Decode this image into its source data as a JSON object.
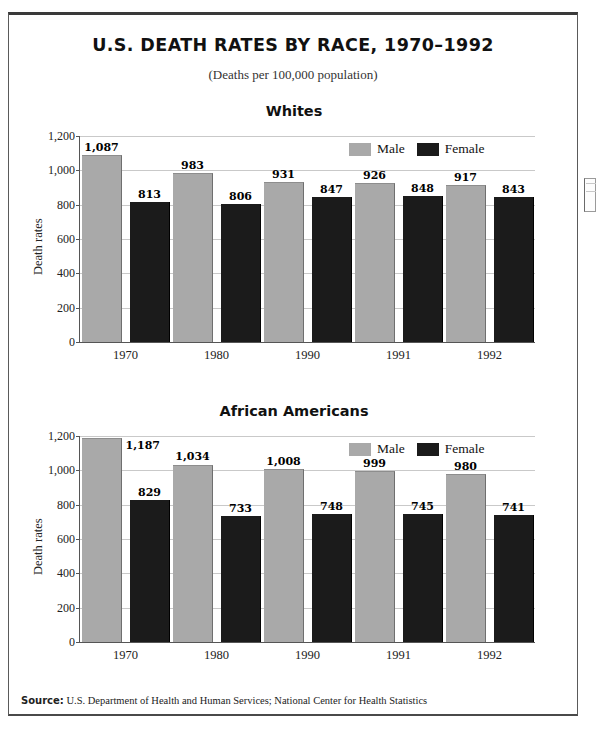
{
  "document": {
    "title": "U.S. DEATH RATES BY RACE, 1970–1992",
    "subtitle": "(Deaths per 100,000 population)",
    "source_label": "Source:",
    "source_text": "U.S. Department of Health and Human Services; National Center for Health Statistics"
  },
  "colors": {
    "male": "#a9a9a9",
    "female": "#1b1b1b",
    "grid": "#c9c9c9",
    "axis": "#555555",
    "text": "#111111"
  },
  "chart_data": [
    {
      "type": "bar",
      "title": "Whites",
      "xlabel": "",
      "ylabel": "Death rates",
      "categories": [
        "1970",
        "1980",
        "1990",
        "1991",
        "1992"
      ],
      "yticks": [
        "0",
        "200",
        "400",
        "600",
        "800",
        "1,000",
        "1,200"
      ],
      "ylim": [
        0,
        1200
      ],
      "grid": true,
      "legend_position": "top-right",
      "series": [
        {
          "name": "Male",
          "color": "#a9a9a9",
          "values": [
            1087,
            983,
            931,
            926,
            917
          ],
          "labels": [
            "1,087",
            "983",
            "931",
            "926",
            "917"
          ]
        },
        {
          "name": "Female",
          "color": "#1b1b1b",
          "values": [
            813,
            806,
            847,
            848,
            843
          ],
          "labels": [
            "813",
            "806",
            "847",
            "848",
            "843"
          ]
        }
      ]
    },
    {
      "type": "bar",
      "title": "African Americans",
      "xlabel": "",
      "ylabel": "Death rates",
      "categories": [
        "1970",
        "1980",
        "1990",
        "1991",
        "1992"
      ],
      "yticks": [
        "0",
        "200",
        "400",
        "600",
        "800",
        "1,000",
        "1,200"
      ],
      "ylim": [
        0,
        1200
      ],
      "grid": true,
      "legend_position": "top-right",
      "series": [
        {
          "name": "Male",
          "color": "#a9a9a9",
          "values": [
            1187,
            1034,
            1008,
            999,
            980
          ],
          "labels": [
            "1,187",
            "1,034",
            "1,008",
            "999",
            "980"
          ]
        },
        {
          "name": "Female",
          "color": "#1b1b1b",
          "values": [
            829,
            733,
            748,
            745,
            741
          ],
          "labels": [
            "829",
            "733",
            "748",
            "745",
            "741"
          ]
        }
      ]
    }
  ]
}
